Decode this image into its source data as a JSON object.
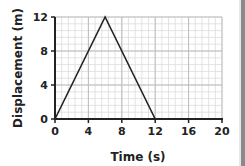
{
  "chart_data": {
    "type": "line",
    "title": "",
    "xlabel": "Time (s)",
    "ylabel": "Displacement (m)",
    "xlim": [
      0,
      20
    ],
    "ylim": [
      0,
      12
    ],
    "xticks": [
      0,
      4,
      8,
      12,
      16,
      20
    ],
    "yticks": [
      0,
      4,
      8,
      12
    ],
    "xtick_labels": [
      "0",
      "4",
      "8",
      "12",
      "16",
      "20"
    ],
    "ytick_labels": [
      "0",
      "4",
      "8",
      "12"
    ],
    "grid": true,
    "legend": null,
    "series": [
      {
        "name": "Displacement",
        "x": [
          0,
          6,
          12
        ],
        "y": [
          0,
          12,
          0
        ],
        "color": "#222222"
      }
    ]
  },
  "colors": {
    "line": "#222222",
    "axis": "#222222",
    "grid_minor": "#dcdcdc",
    "grid_major": "#bdbdbd",
    "edge_bar": "#8a8a8a"
  }
}
